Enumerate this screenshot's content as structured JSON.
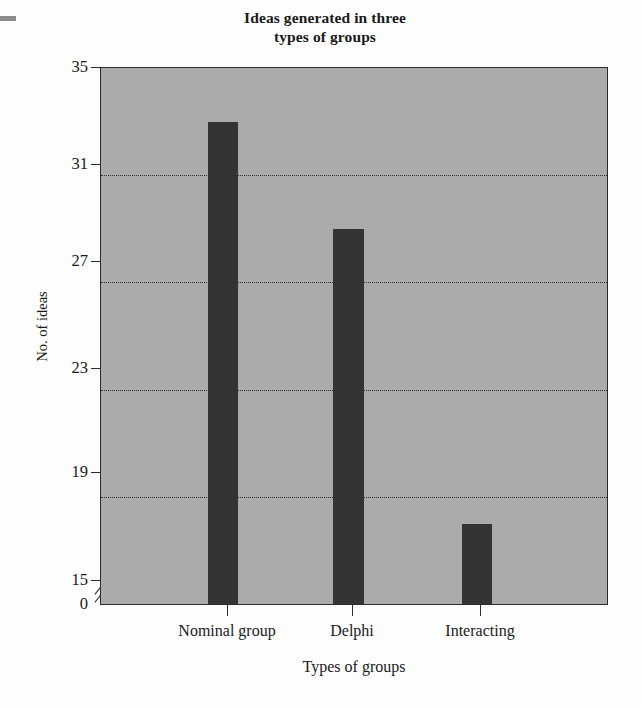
{
  "chart_data": {
    "type": "bar",
    "title": "Ideas generated in three types of groups",
    "title_lines": [
      "Ideas generated in three",
      "types of groups"
    ],
    "categories": [
      "Nominal group",
      "Delphi",
      "Interacting"
    ],
    "values": [
      33,
      29,
      18
    ],
    "xlabel": "Types of groups",
    "ylabel": "No. of ideas",
    "ylim": [
      15,
      35
    ],
    "yticks": [
      35,
      31,
      27,
      23,
      19,
      15
    ],
    "ytick_labels": [
      "35",
      "31",
      "27",
      "23",
      "19",
      "15"
    ],
    "baseline_label": "0",
    "axis_break": true,
    "grid": true,
    "gridlines_at": [
      31,
      27,
      23,
      19
    ],
    "legend": null,
    "colors": {
      "bar": "#343434",
      "plot_background": "#ababab",
      "axis": "#2b2b2b",
      "page_background": "#fdfdfd",
      "text": "#1a1a1a"
    }
  }
}
